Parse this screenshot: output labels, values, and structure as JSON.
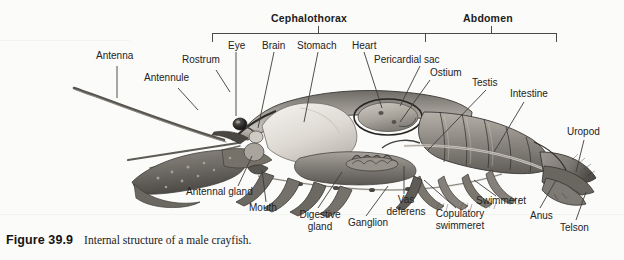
{
  "figure": {
    "background_color": "#fbfbfa",
    "label_color": "#232323",
    "caption_number": "Figure 39.9",
    "caption_text": "Internal structure of a male crayfish.",
    "illustration_alt": "grayscale-anatomical-drawing-of-crayfish-sagittal-section"
  },
  "brackets": [
    {
      "label": "Cephalothorax",
      "x_start": 212,
      "x_end": 425,
      "label_x": 318,
      "label_y": 12
    },
    {
      "label": "Abdomen",
      "x_start": 425,
      "x_end": 557,
      "label_x": 491,
      "label_y": 12
    }
  ],
  "labels": [
    {
      "name": "antenna",
      "text": "Antenna",
      "x": 96,
      "y": 56
    },
    {
      "name": "antennule",
      "text": "Antennule",
      "x": 144,
      "y": 78
    },
    {
      "name": "rostrum",
      "text": "Rostrum",
      "x": 182,
      "y": 59
    },
    {
      "name": "eye",
      "text": "Eye",
      "x": 228,
      "y": 41
    },
    {
      "name": "brain",
      "text": "Brain",
      "x": 264,
      "y": 41
    },
    {
      "name": "stomach",
      "text": "Stomach",
      "x": 300,
      "y": 41
    },
    {
      "name": "heart",
      "text": "Heart",
      "x": 355,
      "y": 41
    },
    {
      "name": "pericardial-sac",
      "text": "Pericardial sac",
      "x": 375,
      "y": 55
    },
    {
      "name": "ostium",
      "text": "Ostium",
      "x": 432,
      "y": 68
    },
    {
      "name": "testis",
      "text": "Testis",
      "x": 474,
      "y": 78
    },
    {
      "name": "intestine",
      "text": "Intestine",
      "x": 512,
      "y": 90
    },
    {
      "name": "uropod",
      "text": "Uropod",
      "x": 569,
      "y": 128
    },
    {
      "name": "antennal-gland",
      "text": "Antennal gland",
      "x": 186,
      "y": 189
    },
    {
      "name": "mouth",
      "text": "Mouth",
      "x": 251,
      "y": 205
    },
    {
      "name": "digestive-gland",
      "text": "Digestive\ngland",
      "x": 299,
      "y": 211
    },
    {
      "name": "ganglion",
      "text": "Ganglion",
      "x": 351,
      "y": 219
    },
    {
      "name": "vas-deferens",
      "text": "Vas\ndeferens",
      "x": 404,
      "y": 197
    },
    {
      "name": "copulatory-swimmeret",
      "text": "Copulatory\nswimmeret",
      "x": 452,
      "y": 211
    },
    {
      "name": "swimmeret",
      "text": "Swimmeret",
      "x": 479,
      "y": 198
    },
    {
      "name": "anus",
      "text": "Anus",
      "x": 534,
      "y": 212
    },
    {
      "name": "telson",
      "text": "Telson",
      "x": 563,
      "y": 224
    }
  ]
}
